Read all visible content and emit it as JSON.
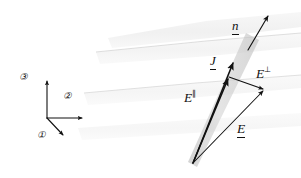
{
  "figure": {
    "width": 301,
    "height": 178,
    "background": "#ffffff",
    "ink_color": "#111111",
    "slab_color": "#c9c9c9",
    "layer_color": "#d8d8d8"
  },
  "axes": {
    "origin": {
      "x": 47,
      "y": 118
    },
    "items": [
      {
        "id": "axis-3",
        "label": "③",
        "label_x": 19,
        "label_y": 73,
        "tip_x": 47,
        "tip_y": 79,
        "direction": "up"
      },
      {
        "id": "axis-2",
        "label": "②",
        "label_x": 63,
        "label_y": 92,
        "tip_x": 84,
        "tip_y": 118,
        "direction": "right"
      },
      {
        "id": "axis-1",
        "label": "①",
        "label_x": 37,
        "label_y": 131,
        "tip_x": 65,
        "tip_y": 137,
        "direction": "down-right"
      }
    ]
  },
  "vectors": [
    {
      "id": "n",
      "label": "n",
      "underlined": true,
      "superscript": "",
      "label_x": 232,
      "label_y": 19,
      "start": {
        "x": 248,
        "y": 50
      },
      "end": {
        "x": 270,
        "y": 14
      },
      "description": "unit normal to the slab surface"
    },
    {
      "id": "J",
      "label": "J",
      "underlined": true,
      "superscript": "",
      "label_x": 210,
      "label_y": 54,
      "start": {
        "x": 193,
        "y": 163
      },
      "end": {
        "x": 234,
        "y": 61
      },
      "description": "current density along the slab"
    },
    {
      "id": "E-parallel",
      "label": "E",
      "underlined": false,
      "superscript": "∥",
      "label_x": 184,
      "label_y": 90,
      "start": {
        "x": 193,
        "y": 163
      },
      "end": {
        "x": 229,
        "y": 77
      },
      "description": "field component parallel to the slab"
    },
    {
      "id": "E-perpendicular",
      "label": "E",
      "underlined": false,
      "superscript": "⊥",
      "label_x": 256,
      "label_y": 66,
      "start": {
        "x": 229,
        "y": 77
      },
      "end": {
        "x": 265,
        "y": 90
      },
      "description": "field component perpendicular to the slab"
    },
    {
      "id": "E-total",
      "label": "E",
      "underlined": true,
      "superscript": "",
      "label_x": 237,
      "label_y": 122,
      "start": {
        "x": 193,
        "y": 163
      },
      "end": {
        "x": 265,
        "y": 90
      },
      "description": "total electric field vector"
    }
  ],
  "slab": {
    "id": "conducting-slab",
    "polygon": "197,166 189,162 246,34 259,40",
    "fill": "#c9c9c9",
    "opacity": 0.55
  },
  "layers": [
    {
      "id": "layer-top",
      "polygon": "108,38 206,21 301,12 301,27 210,38 112,48",
      "opacity": 0.3
    },
    {
      "id": "layer-upper",
      "polygon": "96,52 206,41 301,33 301,47 210,56 100,64",
      "opacity": 0.22
    },
    {
      "id": "layer-middle",
      "polygon": "84,93 196,83 301,75 301,88 200,97 88,105",
      "opacity": 0.2
    },
    {
      "id": "layer-lower",
      "polygon": "78,128 190,120 301,113 301,126 194,133 82,140",
      "opacity": 0.18
    }
  ]
}
